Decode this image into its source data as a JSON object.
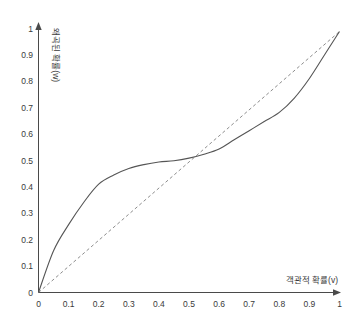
{
  "chart": {
    "title": "",
    "xlabel": "객관적 확률(v)",
    "ylabel": "왜곡된 확률(w)",
    "x_ticks": [
      "0",
      "0.1",
      "0.2",
      "0.3",
      "0.4",
      "0.5",
      "0.6",
      "0.7",
      "0.8",
      "0.9",
      "1"
    ],
    "y_ticks": [
      "0",
      "0.1",
      "0.2",
      "0.3",
      "0.4",
      "0.5",
      "0.6",
      "0.7",
      "0.8",
      "0.9",
      "1"
    ],
    "colors": {
      "curve": "#555555",
      "diagonal": "#8d8d8d",
      "axis": "#4a4a4a",
      "text": "#3a3a3a",
      "background": "#ffffff"
    }
  },
  "chart_data": {
    "type": "line",
    "title": "",
    "xlabel": "객관적 확률(v)",
    "ylabel": "왜곡된 확률(w)",
    "xlim": [
      0,
      1
    ],
    "ylim": [
      0,
      1
    ],
    "grid": false,
    "legend": "none",
    "xticks": [
      0,
      0.1,
      0.2,
      0.3,
      0.4,
      0.5,
      0.6,
      0.7,
      0.8,
      0.9,
      1
    ],
    "yticks": [
      0,
      0.1,
      0.2,
      0.3,
      0.4,
      0.5,
      0.6,
      0.7,
      0.8,
      0.9,
      1
    ],
    "xticklabels": [
      "0",
      "0.1",
      "0.2",
      "0.3",
      "0.4",
      "0.5",
      "0.6",
      "0.7",
      "0.8",
      "0.9",
      "1"
    ],
    "yticklabels": [
      "0",
      "0.1",
      "0.2",
      "0.3",
      "0.4",
      "0.5",
      "0.6",
      "0.7",
      "0.8",
      "0.9",
      "1"
    ],
    "series": [
      {
        "name": "왜곡된 확률 가중함수",
        "style": "solid",
        "color": "#555555",
        "x": [
          0,
          0.05,
          0.1,
          0.15,
          0.2,
          0.25,
          0.3,
          0.35,
          0.4,
          0.45,
          0.5,
          0.55,
          0.6,
          0.65,
          0.7,
          0.75,
          0.8,
          0.85,
          0.9,
          0.95,
          1
        ],
        "y": [
          0,
          0.16,
          0.26,
          0.345,
          0.415,
          0.45,
          0.475,
          0.49,
          0.5,
          0.505,
          0.515,
          0.53,
          0.55,
          0.585,
          0.62,
          0.655,
          0.69,
          0.745,
          0.82,
          0.91,
          1
        ]
      },
      {
        "name": "45도 기준선",
        "style": "dashed",
        "color": "#8d8d8d",
        "x": [
          0,
          1
        ],
        "y": [
          0,
          1
        ]
      }
    ],
    "annotations": [
      {
        "text": "곡선이 45도 선과 교차하는 지점",
        "x": 0.5,
        "y": 0.515
      }
    ]
  }
}
